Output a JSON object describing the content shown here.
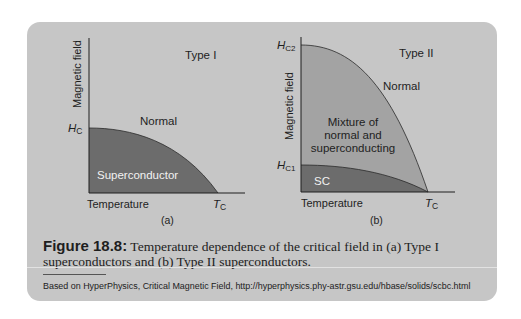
{
  "figure": {
    "number_label": "Figure 18.8:",
    "caption": "Temperature dependence of the critical field in (a) Type I superconductors and (b) Type II superconductors.",
    "source": "Based on HyperPhysics, Critical Magnetic Field, http://hyperphysics.phy-astr.gsu.edu/hbase/solids/scbc.html"
  },
  "panel_a": {
    "type_label": "Type I",
    "y_axis_label": "Magnetic field",
    "x_axis_label": "Temperature",
    "hc_label": "H",
    "hc_sub": "C",
    "tc_label": "T",
    "tc_sub": "C",
    "normal_label": "Normal",
    "region_label": "Superconductor",
    "sublabel": "(a)"
  },
  "panel_b": {
    "type_label": "Type II",
    "y_axis_label": "Magnetic field",
    "x_axis_label": "Temperature",
    "hc2_label": "H",
    "hc2_sub": "C2",
    "hc1_label": "H",
    "hc1_sub": "C1",
    "tc_label": "T",
    "tc_sub": "C",
    "normal_label": "Normal",
    "mixture_line1": "Mixture of",
    "mixture_line2": "normal and",
    "mixture_line3": "superconducting",
    "sc_label": "SC",
    "sublabel": "(b)"
  },
  "colors": {
    "panel_bg": "#c6c6c6",
    "superconductor_fill": "#6c6c6c",
    "mixture_fill": "#a3a3a3",
    "axis": "#1e1e1e"
  }
}
